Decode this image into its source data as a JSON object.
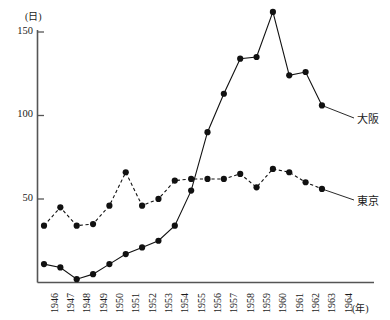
{
  "chart_data": {
    "type": "line",
    "title": "",
    "subtitle": "",
    "xlabel": "(年)",
    "ylabel": "(日)",
    "x": [
      1946,
      1947,
      1948,
      1949,
      1950,
      1951,
      1952,
      1953,
      1954,
      1955,
      1956,
      1957,
      1958,
      1959,
      1960,
      1961,
      1962,
      1963,
      1964
    ],
    "categories": [
      "1946",
      "1947",
      "1948",
      "1949",
      "1950",
      "1951",
      "1952",
      "1953",
      "1954",
      "1955",
      "1956",
      "1957",
      "1958",
      "1959",
      "1960",
      "1961",
      "1962",
      "1963",
      "1964"
    ],
    "xlim": [
      1946,
      1964
    ],
    "ylim": [
      0,
      157
    ],
    "yticks": [
      50,
      100,
      150
    ],
    "ytick_labels": [
      "50",
      "100",
      "150"
    ],
    "grid": false,
    "legend_position": "right-inline",
    "series": [
      {
        "name": "大阪",
        "label": "大阪",
        "style": "solid",
        "marker": "filled-circle",
        "color": "#111111",
        "x": [
          1946,
          1947,
          1948,
          1949,
          1950,
          1951,
          1952,
          1953,
          1954,
          1955,
          1956,
          1957,
          1958,
          1959,
          1960,
          1961,
          1962,
          1963
        ],
        "values": [
          11,
          9,
          2,
          5,
          11,
          17,
          21,
          25,
          34,
          55,
          90,
          113,
          134,
          135,
          162,
          124,
          126,
          106
        ]
      },
      {
        "name": "東京",
        "label": "東京",
        "style": "dashed",
        "marker": "filled-circle",
        "color": "#111111",
        "x": [
          1946,
          1947,
          1948,
          1949,
          1950,
          1951,
          1952,
          1953,
          1954,
          1955,
          1956,
          1957,
          1958,
          1959,
          1960,
          1961,
          1962,
          1963
        ],
        "values": [
          34,
          45,
          34,
          35,
          46,
          66,
          46,
          50,
          61,
          62,
          62,
          62,
          65,
          57,
          68,
          66,
          60,
          56
        ]
      }
    ]
  },
  "axis": {
    "y_unit": "(日)",
    "x_unit": "(年)",
    "y_tick_labels": [
      "150",
      "100",
      "50"
    ],
    "x_tick_labels": [
      "1946",
      "1947",
      "1948",
      "1949",
      "1950",
      "1951",
      "1952",
      "1953",
      "1954",
      "1955",
      "1956",
      "1957",
      "1958",
      "1959",
      "1960",
      "1961",
      "1962",
      "1963",
      "1964"
    ]
  },
  "labels": {
    "osaka": "大阪",
    "tokyo": "東京"
  }
}
